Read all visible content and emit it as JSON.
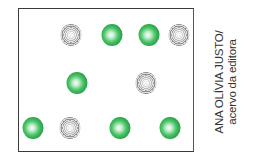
{
  "figure": {
    "frame": {
      "border_color": "#3a3a3a",
      "background": "#ffffff"
    },
    "colors": {
      "green": "#2aa84a",
      "gray": "#a6a6a6"
    },
    "balls": [
      {
        "row": 1,
        "color": "gray",
        "x": 71,
        "y": 35
      },
      {
        "row": 1,
        "color": "green",
        "x": 112,
        "y": 35
      },
      {
        "row": 1,
        "color": "green",
        "x": 149,
        "y": 35
      },
      {
        "row": 1,
        "color": "gray",
        "x": 179,
        "y": 35
      },
      {
        "row": 2,
        "color": "green",
        "x": 77,
        "y": 83
      },
      {
        "row": 2,
        "color": "gray",
        "x": 146,
        "y": 83
      },
      {
        "row": 3,
        "color": "green",
        "x": 33,
        "y": 128
      },
      {
        "row": 3,
        "color": "gray",
        "x": 70,
        "y": 128
      },
      {
        "row": 3,
        "color": "green",
        "x": 120,
        "y": 128
      },
      {
        "row": 3,
        "color": "green",
        "x": 170,
        "y": 128
      }
    ],
    "counts": {
      "green": 6,
      "gray": 4,
      "total": 10
    }
  },
  "credit": {
    "line1": "ANA OLÍVIA JUSTO/",
    "line2": "acervo da editora"
  }
}
